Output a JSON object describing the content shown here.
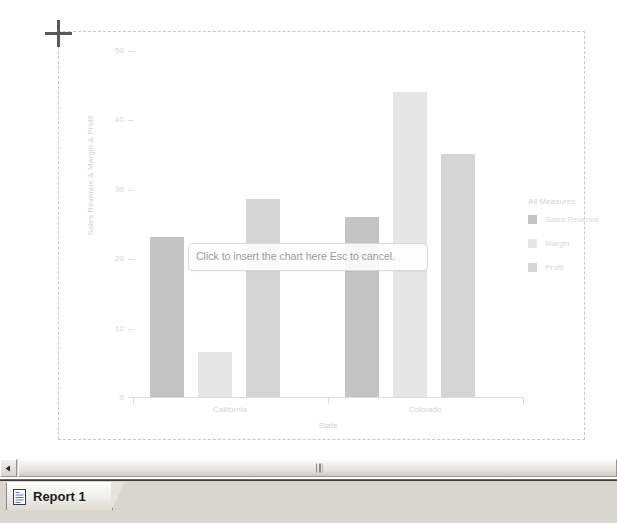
{
  "chart_data": {
    "type": "bar",
    "title": "",
    "xlabel": "State",
    "ylabel": "Sales Revenue & Margin & Profit",
    "categories": [
      "California",
      "Colorado"
    ],
    "ylim": [
      0,
      50
    ],
    "yticks": [
      0,
      10,
      20,
      30,
      40,
      50
    ],
    "grid": false,
    "legend_position": "right",
    "legend_title": "All Measures",
    "series": [
      {
        "name": "Sales Revenue",
        "values": [
          23,
          26
        ],
        "color": "#c4c4c4"
      },
      {
        "name": "Margin",
        "values": [
          6.5,
          44
        ],
        "color": "#e6e6e6"
      },
      {
        "name": "Profit",
        "values": [
          28.5,
          35
        ],
        "color": "#d5d5d5"
      }
    ]
  },
  "chart": {
    "y_axis_title": "Sales Revenue & Margin & Profit",
    "x_axis_title": "State",
    "y_tick_labels": [
      "50",
      "40",
      "30",
      "20",
      "10",
      "0"
    ],
    "x_category_labels": [
      "California",
      "Colorado"
    ],
    "legend": {
      "title": "All Measures",
      "items": [
        {
          "label": "Sales Revenue",
          "color": "#c4c4c4"
        },
        {
          "label": "Margin",
          "color": "#e6e6e6"
        },
        {
          "label": "Profit",
          "color": "#d5d5d5"
        }
      ]
    }
  },
  "tooltip": {
    "text": "Click to insert the chart here Esc to cancel."
  },
  "cursor": {
    "type": "crosshair-cursor"
  },
  "bottom": {
    "scroll_left_icon": "triangle-left-icon",
    "scroll_grip_icon": "scroll-grip-icon",
    "tab": {
      "icon": "report-document-icon",
      "label": "Report 1"
    }
  },
  "colors": {
    "dashed_frame": "#c9c9c9",
    "tooltip_border": "#d9d9d9",
    "chrome_face": "#d4d0c8"
  }
}
